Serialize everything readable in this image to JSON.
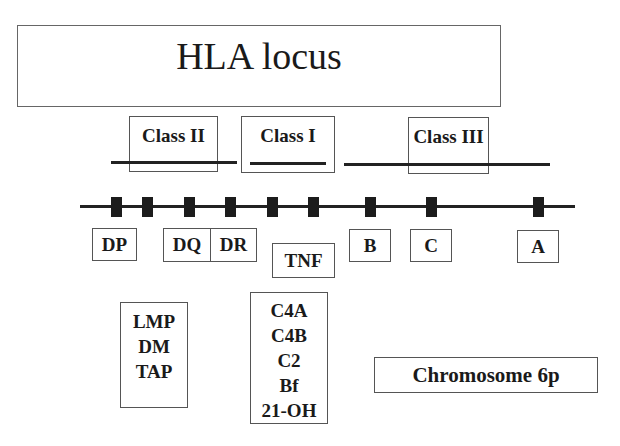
{
  "title": "HLA locus",
  "classes": [
    {
      "id": "class-ii",
      "label": "Class II"
    },
    {
      "id": "class-iii",
      "label": "Class III"
    },
    {
      "id": "class-i",
      "label": "Class I"
    }
  ],
  "chromosome": {
    "marker_count": 9
  },
  "genes": [
    {
      "id": "dp",
      "label": "DP"
    },
    {
      "id": "dq",
      "label": "DQ"
    },
    {
      "id": "dr",
      "label": "DR"
    },
    {
      "id": "tnf",
      "label": "TNF"
    },
    {
      "id": "b",
      "label": "B"
    },
    {
      "id": "c",
      "label": "C"
    },
    {
      "id": "a",
      "label": "A"
    }
  ],
  "class_ii_extra_genes": [
    "LMP",
    "DM",
    "TAP"
  ],
  "class_iii_extra_genes": [
    "C4A",
    "C4B",
    "C2",
    "Bf",
    "21-OH"
  ],
  "chromosome_label": "Chromosome 6p",
  "colors": {
    "line": "#222222",
    "marker": "#1c1c1c",
    "border": "#555555",
    "text": "#1a1a1a"
  }
}
